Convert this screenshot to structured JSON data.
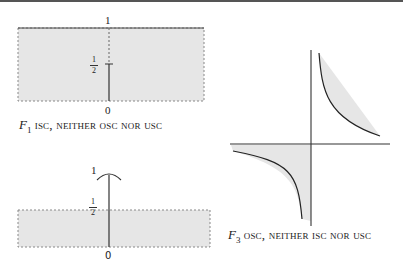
{
  "figure": {
    "panels": [
      {
        "id": "F1",
        "name": "F",
        "subscript": "1",
        "caption_rest": "isc, neither osc nor usc",
        "top_label": "1",
        "mid_label_num": "1",
        "mid_label_den": "2",
        "bottom_label": "0"
      },
      {
        "id": "F2",
        "top_label": "1",
        "mid_label_num": "1",
        "mid_label_den": "2",
        "bottom_label": "0"
      },
      {
        "id": "F3",
        "name": "F",
        "subscript": "3",
        "caption_rest": "osc, neither isc nor usc"
      }
    ],
    "colors": {
      "shade": "#e6e6e6",
      "line": "#333333",
      "dashed": "#777777"
    }
  }
}
